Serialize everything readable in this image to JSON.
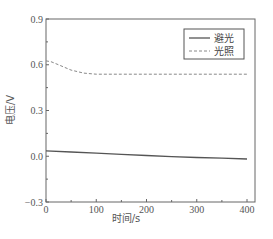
{
  "chart_data": {
    "type": "line",
    "title": "",
    "xlabel": "时间/s",
    "ylabel": "电压/V",
    "xlim": [
      0,
      405
    ],
    "ylim": [
      -0.3,
      0.9
    ],
    "x_ticks": [
      "0",
      "100",
      "200",
      "300",
      "400"
    ],
    "y_ticks": [
      "-0.3",
      "0.0",
      "0.3",
      "0.6",
      "0.9"
    ],
    "grid": false,
    "legend_position": "upper right",
    "series": [
      {
        "name": "避光",
        "style": "solid",
        "color": "#555555",
        "x": [
          0,
          50,
          100,
          150,
          200,
          250,
          300,
          350,
          400
        ],
        "values": [
          0.035,
          0.028,
          0.02,
          0.012,
          0.005,
          -0.002,
          -0.008,
          -0.013,
          -0.018
        ]
      },
      {
        "name": "光照",
        "style": "dashed",
        "color": "#888888",
        "x": [
          0,
          10,
          25,
          50,
          75,
          100,
          150,
          200,
          250,
          300,
          350,
          400
        ],
        "values": [
          0.625,
          0.62,
          0.6,
          0.565,
          0.545,
          0.538,
          0.538,
          0.538,
          0.538,
          0.538,
          0.538,
          0.538
        ]
      }
    ]
  },
  "legend": {
    "items": [
      {
        "label": "避光"
      },
      {
        "label": "光照"
      }
    ]
  },
  "axes": {
    "xlabel": "时间/s",
    "ylabel": "电压/V"
  }
}
